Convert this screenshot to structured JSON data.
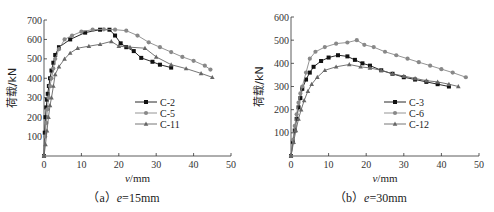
{
  "chart_data": [
    {
      "type": "line",
      "title": "",
      "caption": "（a）e=15mm",
      "caption_prefix": "（a）",
      "caption_var": "e",
      "caption_rest": "=15mm",
      "xlabel": "v/mm",
      "ylabel": "荷载/kN",
      "xlim": [
        0,
        50
      ],
      "ylim": [
        0,
        700
      ],
      "xticks": [
        0,
        10,
        20,
        30,
        40,
        50
      ],
      "yticks": [
        100,
        200,
        300,
        400,
        500,
        600,
        700
      ],
      "grid": false,
      "legend_position": "center-right",
      "series": [
        {
          "name": "C-2",
          "marker": "square",
          "color": "#111111",
          "x": [
            0,
            0.2,
            0.4,
            0.6,
            0.8,
            1.0,
            1.3,
            1.6,
            2.0,
            2.5,
            3.0,
            4.0,
            7.0,
            11.0,
            15.0,
            17.5,
            19.0,
            20.5,
            22.0,
            24.0,
            26.0,
            29.0,
            31.0,
            34.0
          ],
          "y": [
            0,
            120,
            200,
            250,
            290,
            320,
            360,
            400,
            440,
            480,
            520,
            560,
            600,
            635,
            650,
            650,
            620,
            580,
            560,
            540,
            505,
            485,
            470,
            455
          ]
        },
        {
          "name": "C-5",
          "marker": "circle",
          "color": "#888888",
          "x": [
            0,
            0.3,
            0.6,
            0.9,
            1.2,
            1.6,
            2.0,
            2.5,
            3.0,
            4.0,
            5.5,
            7.5,
            10.0,
            13.0,
            16.0,
            19.0,
            22.0,
            25.0,
            28.0,
            31.0,
            34.0,
            37.0,
            40.0,
            43.0,
            44.5
          ],
          "y": [
            0,
            100,
            170,
            240,
            300,
            360,
            400,
            450,
            500,
            550,
            600,
            620,
            640,
            650,
            652,
            650,
            645,
            620,
            585,
            560,
            535,
            510,
            490,
            465,
            445
          ]
        },
        {
          "name": "C-11",
          "marker": "triangle",
          "color": "#666666",
          "x": [
            0,
            0.4,
            0.8,
            1.2,
            1.6,
            2.0,
            2.5,
            3.0,
            4.0,
            5.5,
            7.0,
            9.0,
            12.0,
            15.0,
            18.0,
            20.0,
            23.0,
            27.0,
            30.0,
            34.0,
            38.0,
            42.0,
            45.0
          ],
          "y": [
            0,
            60,
            130,
            200,
            260,
            300,
            360,
            420,
            460,
            500,
            530,
            555,
            565,
            575,
            590,
            565,
            560,
            555,
            510,
            470,
            450,
            425,
            405
          ]
        }
      ]
    },
    {
      "type": "line",
      "title": "",
      "caption": "（b）e=30mm",
      "caption_prefix": "（b）",
      "caption_var": "e",
      "caption_rest": "=30mm",
      "xlabel": "v/mm",
      "ylabel": "荷载/kN",
      "xlim": [
        0,
        50
      ],
      "ylim": [
        0,
        600
      ],
      "xticks": [
        0,
        10,
        20,
        30,
        40,
        50
      ],
      "yticks": [
        100,
        200,
        300,
        400,
        500,
        600
      ],
      "grid": false,
      "legend_position": "center-right",
      "series": [
        {
          "name": "C-3",
          "marker": "square",
          "color": "#111111",
          "x": [
            0,
            0.5,
            1.0,
            1.5,
            2.0,
            2.5,
            3.0,
            4.0,
            5.0,
            6.0,
            8.0,
            10.0,
            12.5,
            15.0,
            17.0,
            19.0,
            21.0,
            24.0,
            27.0,
            30.0,
            33.0,
            36.0,
            39.0,
            42.0
          ],
          "y": [
            0,
            60,
            110,
            160,
            210,
            250,
            290,
            330,
            360,
            385,
            410,
            425,
            435,
            430,
            415,
            400,
            390,
            370,
            355,
            340,
            330,
            320,
            310,
            300
          ]
        },
        {
          "name": "C-6",
          "marker": "circle",
          "color": "#888888",
          "x": [
            0,
            0.5,
            1.0,
            1.5,
            2.0,
            2.5,
            3.0,
            4.0,
            5.0,
            6.5,
            9.0,
            12.0,
            15.0,
            17.5,
            19.5,
            22.0,
            25.0,
            28.0,
            31.0,
            34.0,
            37.0,
            40.0,
            43.0,
            46.5
          ],
          "y": [
            0,
            70,
            130,
            180,
            230,
            270,
            300,
            360,
            420,
            450,
            470,
            485,
            490,
            500,
            480,
            470,
            450,
            435,
            420,
            405,
            390,
            375,
            360,
            340
          ]
        },
        {
          "name": "C-12",
          "marker": "triangle",
          "color": "#666666",
          "x": [
            0,
            0.7,
            1.3,
            2.0,
            2.7,
            3.5,
            4.5,
            5.5,
            7.0,
            9.0,
            12.0,
            15.5,
            18.5,
            21.0,
            24.0,
            27.0,
            30.0,
            33.0,
            36.0,
            39.0,
            42.0,
            44.5
          ],
          "y": [
            0,
            60,
            110,
            160,
            200,
            240,
            280,
            310,
            340,
            370,
            385,
            395,
            385,
            380,
            370,
            355,
            345,
            335,
            325,
            320,
            310,
            300
          ]
        }
      ]
    }
  ]
}
